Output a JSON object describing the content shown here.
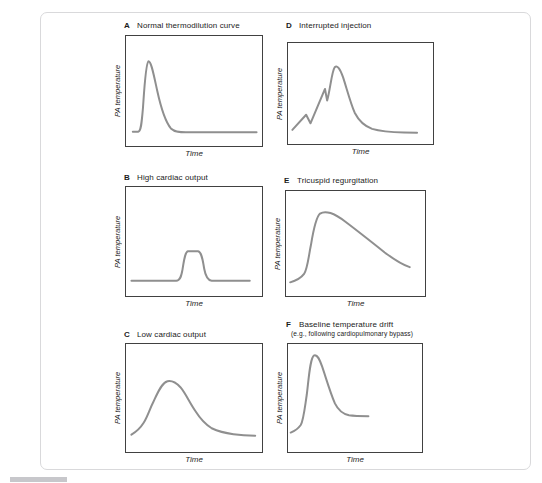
{
  "page": {
    "background": "#ffffff",
    "frame_border_color": "#d9d9db",
    "plot_box_border_color": "#414141",
    "cropped_bar_color": "#c7c7cb"
  },
  "figure": {
    "shared_ylabel": "PA temperature",
    "shared_xlabel": "Time"
  },
  "chart_coords_note": "curve_svg_path coordinates: x 0-100 = Time increasing left to right; y 0-100 runs top to bottom, so smaller y = larger PA temperature deflection. Axes are qualitative with no tick marks or numeric values.",
  "chart_data": [
    {
      "type": "line",
      "panel_letter": "A",
      "title": "Normal thermodilution curve",
      "xlabel": "Time",
      "ylabel": "PA temperature",
      "curve_color": "#8f8f8f",
      "shape_description": "Flat start, rapid smooth upstroke to a single tall narrow peak, exponential decay back to a flat baseline tail",
      "curve_svg_path": "M 5 87 L 9 87 C 11 86.5 11.5 80 12.5 65 C 13.5 47 14.5 25 16.5 23 C 18.5 23 20 33 23 50 C 25.5 64 29 78 33 84 C 36 87.5 40 87.5 44 87.5 L 96 87.5"
    },
    {
      "type": "line",
      "panel_letter": "B",
      "title": "High cardiac output",
      "xlabel": "Time",
      "ylabel": "PA temperature",
      "curve_color": "#8f8f8f",
      "shape_description": "Long flat baseline, then a small short narrow flat-topped peak (small area under curve) returning quickly to baseline",
      "curve_svg_path": "M 4 86 L 37 86 C 39.5 86 40.5 83 41.5 76 C 42.5 68 43.5 59.5 45.5 59 L 53 59 C 55.5 59.5 56.5 67 57.5 75 C 58.5 82 60 85.5 63 86 L 91 86"
    },
    {
      "type": "line",
      "panel_letter": "C",
      "title": "Low cardiac output",
      "xlabel": "Time",
      "ylabel": "PA temperature",
      "curve_color": "#8f8f8f",
      "shape_description": "Slow gradual rise to a broad rounded peak with a slow prolonged decay and long tail (large area under curve)",
      "curve_svg_path": "M 4 84 C 8 81 11 77 13 73 C 16 67 17.5 60 20 54 C 23 46 26 36 30.5 34.5 C 34 33.5 37 36 40 40 C 44 46 47 55 51 62 C 54 68 58 74 63 78 C 68 81 73 82.5 79 83.5 C 84 84.3 90 84.8 95 85"
    },
    {
      "type": "line",
      "panel_letter": "D",
      "title": "Interrupted injection",
      "xlabel": "Time",
      "ylabel": "PA temperature",
      "curve_color": "#8f8f8f",
      "shape_description": "Irregular jagged upstroke with two false-start notches before the main rounded peak, then decay to baseline",
      "curve_svg_path": "M 3 86 L 12.5 71 L 15.5 79.5 L 25.5 45.5 L 27 57 C 29 47 30.2 28 32.2 24 C 34.2 21.5 36 26 38 34 C 40.5 45 43 59 46 69 C 48.5 76 52.5 82 58 85 C 64 87.5 72 88.3 80 88.6 L 89 88.8"
    },
    {
      "type": "line",
      "panel_letter": "E",
      "title": "Tricuspid regurgitation",
      "xlabel": "Time",
      "ylabel": "PA temperature",
      "curve_color": "#8f8f8f",
      "shape_description": "Rapid rise to an early rounded peak followed by a long slow nearly linear decline (prolonged decay, does not return to baseline)",
      "curve_svg_path": "M 3 87 C 7 85.5 10.5 83.5 13 79 C 15.5 74 16 64 18 51 C 19.5 39 21.5 25 24.5 21.5 C 26.5 19.8 29 19.8 32 21 C 35.5 22.5 39 25.5 43 29.5 C 52 38.5 62 49 71 58.5 C 78 65.5 84.5 70.5 89 72.5"
    },
    {
      "type": "line",
      "panel_letter": "F",
      "title": "Baseline temperature drift",
      "subtitle": "(e.g., following cardiopulmonary bypass)",
      "xlabel": "Time",
      "ylabel": "PA temperature",
      "curve_color": "#8f8f8f",
      "shape_description": "Sharp rise to an early tall peak, then decline to a plateau that remains above the initial baseline (drifted baseline)",
      "curve_svg_path": "M 2 82 C 5 80.5 7.5 78.5 9.5 75 C 11.5 71 12.3 61 14 47 C 15.5 32 16.5 12.5 19.5 10.5 C 22 9.5 23.5 14 25.5 21 C 28.5 32 31.5 45 35 55 C 38 62.5 41.5 65 45.5 66 C 50 66.8 55 66.8 60 66.8"
    }
  ]
}
